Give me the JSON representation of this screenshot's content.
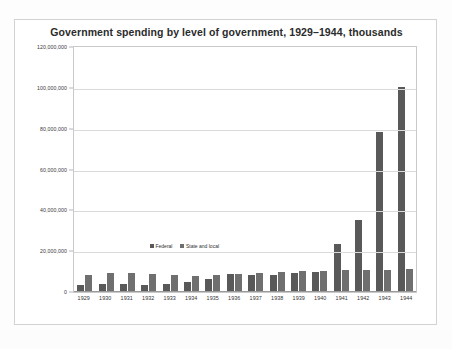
{
  "chart_data": {
    "type": "bar",
    "title": "Government spending by level of government, 1929–1944, thousands",
    "xlabel": "",
    "ylabel": "",
    "ylim": [
      0,
      120000000
    ],
    "ytick_labels": [
      "120,000,000",
      "100,000,000",
      "80,000,000",
      "60,000,000",
      "40,000,000",
      "20,000,000",
      "0"
    ],
    "ytick_values": [
      120000000,
      100000000,
      80000000,
      60000000,
      40000000,
      20000000,
      0
    ],
    "grid": true,
    "legend_position": "inside-left",
    "categories": [
      "1929",
      "1930",
      "1931",
      "1932",
      "1933",
      "1934",
      "1935",
      "1936",
      "1937",
      "1938",
      "1939",
      "1940",
      "1941",
      "1942",
      "1943",
      "1944"
    ],
    "series": [
      {
        "name": "Federal",
        "color": "#595959",
        "values": [
          3100000,
          3300000,
          3600000,
          3000000,
          3400000,
          4600000,
          5900000,
          8400000,
          7700000,
          8000000,
          9000000,
          9500000,
          23000000,
          35000000,
          78000000,
          100000000
        ]
      },
      {
        "name": "State and local",
        "color": "#6f6f6f",
        "values": [
          7800000,
          8700000,
          8900000,
          8500000,
          7700000,
          7200000,
          7800000,
          8500000,
          8900000,
          9300000,
          9600000,
          10000000,
          10300000,
          10500000,
          10500000,
          10800000
        ]
      }
    ]
  },
  "legend": {
    "items": [
      {
        "label": "Federal"
      },
      {
        "label": "State and local"
      }
    ]
  }
}
